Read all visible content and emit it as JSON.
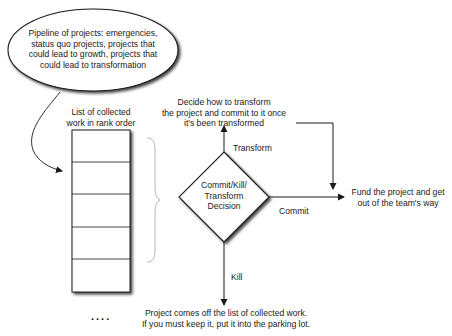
{
  "diagram": {
    "pipeline_bubble": {
      "text": "Pipeline of projects: emergencies,\nstatus quo projects, projects that\ncould lead to growth, projects that\ncould lead to transformation"
    },
    "list": {
      "caption": "List of collected\nwork in rank order",
      "row_count": 5,
      "continuation": "...."
    },
    "decision": {
      "text": "Commit/Kill/\nTransform\nDecision"
    },
    "edges": {
      "transform_label": "Transform",
      "commit_label": "Commit",
      "kill_label": "Kill"
    },
    "outcomes": {
      "transform": "Decide how to transform\nthe project and commit to it once\nit's been transformed",
      "commit": "Fund the project and get\nout of the team's way",
      "kill": "Project comes off the list of collected work.\nIf you must keep it, put it into the parking lot."
    },
    "colors": {
      "line": "#1a1a1a",
      "shadow": "#6b6b6b",
      "fill": "#ffffff",
      "brace": "#b5b5b5"
    }
  }
}
